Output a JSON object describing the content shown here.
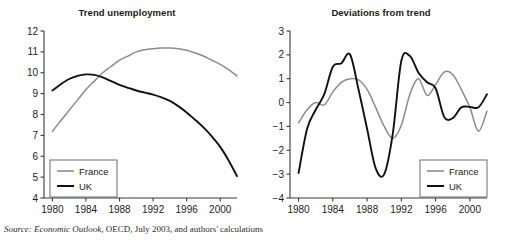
{
  "figure": {
    "source_note": {
      "label": "Source:",
      "italic_part": " Economic Outlook",
      "rest": ", OECD, July 2003, and authors' calculations",
      "full": "Source: Economic Outlook, OECD, July 2003, and authors' calculations"
    },
    "colors": {
      "france": "#8c8c8c",
      "uk": "#111111",
      "axis": "#3a3a3a",
      "background": "#ffffff"
    }
  },
  "chart_data": [
    {
      "type": "line",
      "title": "Trend unemployment",
      "xlabel": "",
      "ylabel": "",
      "xlim": [
        1979,
        2002
      ],
      "ylim": [
        4,
        12
      ],
      "xticks": [
        1980,
        1984,
        1988,
        1992,
        1996,
        2000
      ],
      "yticks": [
        4,
        5,
        6,
        7,
        8,
        9,
        10,
        11,
        12
      ],
      "grid": false,
      "legend_position": "lower-left",
      "x": [
        1980,
        1981,
        1982,
        1983,
        1984,
        1985,
        1986,
        1987,
        1988,
        1989,
        1990,
        1991,
        1992,
        1993,
        1994,
        1995,
        1996,
        1997,
        1998,
        1999,
        2000,
        2001,
        2002
      ],
      "series": [
        {
          "name": "France",
          "color": "#8c8c8c",
          "values": [
            7.2,
            7.7,
            8.2,
            8.7,
            9.2,
            9.6,
            10.0,
            10.3,
            10.6,
            10.8,
            11.0,
            11.1,
            11.15,
            11.18,
            11.18,
            11.15,
            11.08,
            10.95,
            10.8,
            10.6,
            10.4,
            10.15,
            9.85
          ]
        },
        {
          "name": "UK",
          "color": "#111111",
          "values": [
            9.15,
            9.45,
            9.7,
            9.85,
            9.92,
            9.9,
            9.78,
            9.6,
            9.42,
            9.28,
            9.15,
            9.05,
            8.95,
            8.82,
            8.65,
            8.4,
            8.1,
            7.75,
            7.38,
            6.95,
            6.45,
            5.8,
            5.05
          ]
        }
      ]
    },
    {
      "type": "line",
      "title": "Deviations from trend",
      "xlabel": "",
      "ylabel": "",
      "xlim": [
        1979,
        2002
      ],
      "ylim": [
        -4,
        3
      ],
      "xticks": [
        1980,
        1984,
        1988,
        1992,
        1996,
        2000
      ],
      "yticks": [
        -4,
        -3,
        -2,
        -1,
        0,
        1,
        2,
        3
      ],
      "grid": false,
      "legend_position": "lower-right",
      "x": [
        1980,
        1981,
        1982,
        1983,
        1984,
        1985,
        1986,
        1987,
        1988,
        1989,
        1990,
        1991,
        1992,
        1993,
        1994,
        1995,
        1996,
        1997,
        1998,
        1999,
        2000,
        2001,
        2002
      ],
      "series": [
        {
          "name": "France",
          "color": "#8c8c8c",
          "values": [
            -0.85,
            -0.3,
            0.0,
            -0.1,
            0.45,
            0.85,
            1.0,
            0.95,
            0.55,
            -0.2,
            -1.0,
            -1.5,
            -0.95,
            0.35,
            1.0,
            0.3,
            0.75,
            1.28,
            1.18,
            0.55,
            -0.2,
            -1.2,
            -0.35
          ]
        },
        {
          "name": "UK",
          "color": "#111111",
          "values": [
            -2.95,
            -1.1,
            -0.3,
            0.35,
            1.5,
            1.65,
            2.02,
            0.55,
            -1.1,
            -2.75,
            -3.0,
            -1.3,
            1.75,
            1.95,
            1.25,
            0.85,
            0.6,
            -0.6,
            -0.65,
            -0.2,
            -0.18,
            -0.2,
            0.35
          ]
        }
      ]
    }
  ]
}
